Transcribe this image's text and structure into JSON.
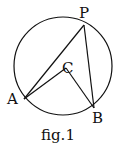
{
  "figure": {
    "caption": "fig.1",
    "circle": {
      "cx": 63,
      "cy": 66,
      "r": 49
    },
    "points": {
      "P": {
        "label": "P",
        "x": 84,
        "y": 25
      },
      "A": {
        "label": "A",
        "x": 24,
        "y": 99
      },
      "B": {
        "label": "B",
        "x": 94,
        "y": 108
      },
      "C": {
        "label": "C",
        "x": 66,
        "y": 68
      }
    },
    "segments": [
      "PA",
      "PB",
      "CA",
      "CB"
    ],
    "stroke_color": "#111111"
  }
}
